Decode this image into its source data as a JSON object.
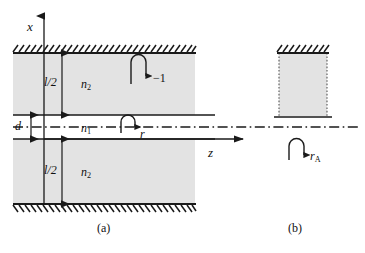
{
  "figure": {
    "type": "optical-waveguide-cross-section",
    "panels": [
      {
        "id": "a",
        "caption": "(a)",
        "axes": [
          {
            "name": "x-axis",
            "label": "x",
            "direction": "up"
          },
          {
            "name": "z-axis",
            "label": "z",
            "direction": "right"
          }
        ],
        "regions": [
          {
            "name": "upper-cladding",
            "label": "n",
            "subscript": "2",
            "fill": "#e3e3e3"
          },
          {
            "name": "core",
            "label": "n",
            "subscript": "1",
            "fill": "#ffffff"
          },
          {
            "name": "lower-cladding",
            "label": "n",
            "subscript": "2",
            "fill": "#e3e3e3"
          }
        ],
        "dimensions": [
          {
            "name": "upper-cladding-thickness",
            "label": "l/2"
          },
          {
            "name": "core-thickness",
            "label": "d"
          },
          {
            "name": "lower-cladding-thickness",
            "label": "l/2"
          }
        ],
        "reflection_markers": [
          {
            "name": "wall-reflection",
            "label": "−1"
          },
          {
            "name": "core-reflection",
            "label": "r"
          }
        ],
        "boundaries": [
          {
            "name": "top-wall",
            "style": "hatched"
          },
          {
            "name": "bottom-wall",
            "style": "hatched"
          }
        ]
      },
      {
        "id": "b",
        "caption": "(b)",
        "regions": [
          {
            "name": "half-slab",
            "fill": "#e3e3e3",
            "border": "dotted"
          }
        ],
        "reflection_markers": [
          {
            "name": "antisymmetric-reflection",
            "label": "r",
            "subscript": "A"
          }
        ],
        "boundaries": [
          {
            "name": "top-wall",
            "style": "hatched"
          },
          {
            "name": "bottom-edge",
            "style": "solid"
          }
        ]
      }
    ],
    "centerline": {
      "name": "symmetry-axis",
      "style": "dash-dot"
    },
    "colors": {
      "cladding_fill": "#e3e3e3",
      "line": "#1a1a1a",
      "background": "#ffffff"
    }
  }
}
